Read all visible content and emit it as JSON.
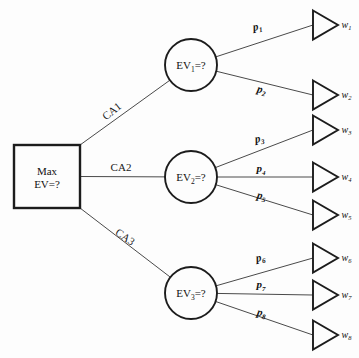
{
  "diagram": {
    "type": "decision-tree",
    "background_color": "#fdfdfd",
    "line_color": "#4a4a4a",
    "outline_color": "#1c1c1c"
  },
  "decision_node": {
    "id": "root",
    "shape": "square",
    "line1": "Max",
    "line2": "EV=?",
    "x": 14,
    "y": 145,
    "width": 66,
    "height": 63
  },
  "branches": [
    {
      "id": "ca1",
      "label": "CA1",
      "from": "root",
      "to": "ev1",
      "label_x": 114,
      "label_y": 114,
      "rotation": -39
    },
    {
      "id": "ca2",
      "label": "CA2",
      "from": "root",
      "to": "ev2",
      "label_x": 121,
      "label_y": 171,
      "rotation": 0
    },
    {
      "id": "ca3",
      "label": "CA3",
      "from": "root",
      "to": "ev3",
      "label_x": 123,
      "label_y": 240,
      "rotation": 35
    }
  ],
  "chance_nodes": [
    {
      "id": "ev1",
      "shape": "circle",
      "prefix": "EV",
      "subscript": "1",
      "suffix": "=?",
      "cx": 191,
      "cy": 65,
      "r": 26
    },
    {
      "id": "ev2",
      "shape": "circle",
      "prefix": "EV",
      "subscript": "2",
      "suffix": "=?",
      "cx": 191,
      "cy": 177,
      "r": 26
    },
    {
      "id": "ev3",
      "shape": "circle",
      "prefix": "EV",
      "subscript": "3",
      "suffix": "=?",
      "cx": 191,
      "cy": 293,
      "r": 26
    }
  ],
  "probabilities": [
    {
      "id": "p1",
      "prefix": "p",
      "subscript": "1",
      "from": "ev1",
      "to": "w1",
      "label_x": 258,
      "label_y": 30,
      "rotation": -11
    },
    {
      "id": "p2",
      "prefix": "p",
      "subscript": "2",
      "from": "ev1",
      "to": "w2",
      "label_x": 261,
      "label_y": 93,
      "rotation": 12
    },
    {
      "id": "p3",
      "prefix": "p",
      "subscript": "3",
      "from": "ev2",
      "to": "w3",
      "label_x": 260,
      "label_y": 142,
      "rotation": -11
    },
    {
      "id": "p4",
      "prefix": "p",
      "subscript": "4",
      "from": "ev2",
      "to": "w4",
      "label_x": 261,
      "label_y": 172,
      "rotation": 0
    },
    {
      "id": "p5",
      "prefix": "p",
      "subscript": "5",
      "from": "ev2",
      "to": "w5",
      "label_x": 261,
      "label_y": 199,
      "rotation": 11
    },
    {
      "id": "p6",
      "prefix": "p",
      "subscript": "6",
      "from": "ev3",
      "to": "w6",
      "label_x": 261,
      "label_y": 261,
      "rotation": -11
    },
    {
      "id": "p7",
      "prefix": "p",
      "subscript": "7",
      "from": "ev3",
      "to": "w7",
      "label_x": 261,
      "label_y": 288,
      "rotation": 0
    },
    {
      "id": "p8",
      "prefix": "p",
      "subscript": "8",
      "from": "ev3",
      "to": "w8",
      "label_x": 261,
      "label_y": 316,
      "rotation": 11
    }
  ],
  "outcome_nodes": [
    {
      "id": "w1",
      "shape": "triangle",
      "prefix": "w",
      "subscript": "1",
      "x": 313,
      "cy": 25
    },
    {
      "id": "w2",
      "shape": "triangle",
      "prefix": "w",
      "subscript": "2",
      "x": 313,
      "cy": 95
    },
    {
      "id": "w3",
      "shape": "triangle",
      "prefix": "w",
      "subscript": "3",
      "x": 313,
      "cy": 130
    },
    {
      "id": "w4",
      "shape": "triangle",
      "prefix": "w",
      "subscript": "4",
      "x": 313,
      "cy": 177
    },
    {
      "id": "w5",
      "shape": "triangle",
      "prefix": "w",
      "subscript": "5",
      "x": 313,
      "cy": 215
    },
    {
      "id": "w6",
      "shape": "triangle",
      "prefix": "w",
      "subscript": "6",
      "x": 313,
      "cy": 258
    },
    {
      "id": "w7",
      "shape": "triangle",
      "prefix": "w",
      "subscript": "7",
      "x": 313,
      "cy": 295
    },
    {
      "id": "w8",
      "shape": "triangle",
      "prefix": "w",
      "subscript": "8",
      "x": 313,
      "cy": 335
    }
  ]
}
